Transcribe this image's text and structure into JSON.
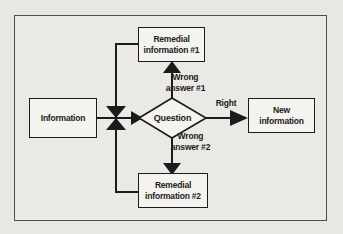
{
  "figure": {
    "type": "flowchart",
    "colors": {
      "page_bg": "#e9e7e3",
      "frame_border": "#4e4e4c",
      "ink": "#1b1b1b",
      "node_fill": "#f4f3ef"
    }
  },
  "nodes": {
    "information": {
      "label": "Information"
    },
    "question": {
      "label": "Question"
    },
    "remedial_1": {
      "label": "Remedial\ninformation #1"
    },
    "remedial_2": {
      "label": "Remedial\ninformation #2"
    },
    "new_information": {
      "label": "New\ninformation"
    }
  },
  "edges": {
    "wrong_answer_1": {
      "label": "Wrong\nanswer #1",
      "from": "question",
      "to": "remedial_1"
    },
    "wrong_answer_2": {
      "label": "Wrong\nanswer #2",
      "from": "question",
      "to": "remedial_2"
    },
    "right": {
      "label": "Right",
      "from": "question",
      "to": "new_information"
    }
  }
}
